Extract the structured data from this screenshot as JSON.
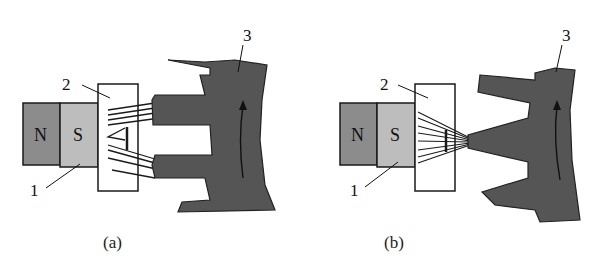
{
  "figure": {
    "panels": [
      {
        "id": "a",
        "caption": "(a)",
        "magnet": {
          "north_label": "N",
          "south_label": "S"
        },
        "callouts": {
          "magnet": "1",
          "sensor": "2",
          "gear": "3"
        },
        "state": "sensor facing gap between gear teeth, flux lines split to two teeth"
      },
      {
        "id": "b",
        "caption": "(b)",
        "magnet": {
          "north_label": "N",
          "south_label": "S"
        },
        "callouts": {
          "magnet": "1",
          "sensor": "2",
          "gear": "3"
        },
        "state": "sensor facing a gear tooth, flux lines concentrated"
      }
    ],
    "colors": {
      "north_pole": "#8c8c8c",
      "south_pole": "#bdbdbd",
      "gear": "#555555",
      "outline": "#1a1a1a"
    }
  }
}
